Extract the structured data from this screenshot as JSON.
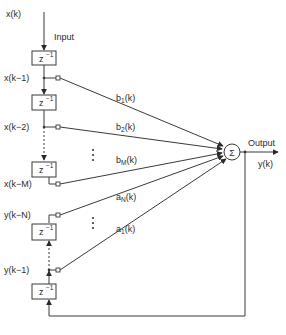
{
  "diagram": {
    "type": "iir-adaptive-filter-block-diagram",
    "input_signal": "x(k)",
    "input_label": "Input",
    "output_label": "Output",
    "output_signal": "y(k)",
    "summer_symbol": "Σ",
    "delay_block": {
      "base": "z",
      "exponent": "−1"
    },
    "feedforward_taps": [
      {
        "signal": "x(k−1)",
        "weight_base": "b",
        "weight_sub": "1",
        "weight_arg": "(k)"
      },
      {
        "signal": "x(k−2)",
        "weight_base": "b",
        "weight_sub": "2",
        "weight_arg": "(k)"
      },
      {
        "signal": "x(k−M)",
        "weight_base": "b",
        "weight_sub": "M",
        "weight_arg": "(k)"
      }
    ],
    "feedback_taps": [
      {
        "signal": "y(k−N)",
        "weight_base": "a",
        "weight_sub": "N",
        "weight_arg": "(k)"
      },
      {
        "signal": "y(k−1)",
        "weight_base": "a",
        "weight_sub": "1",
        "weight_arg": "(k)"
      }
    ],
    "ellipsis": "⋮"
  }
}
